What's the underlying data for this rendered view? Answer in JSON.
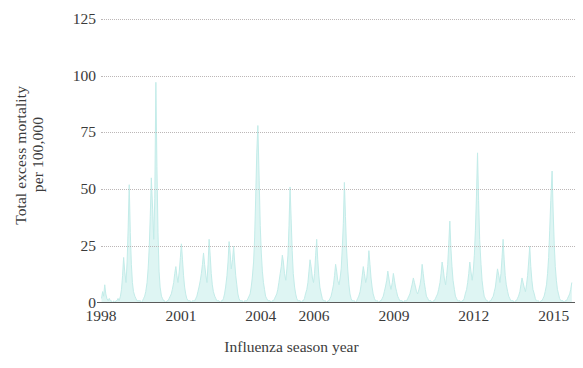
{
  "chart_data": {
    "type": "line",
    "title": "",
    "subtitle": "",
    "xlabel": "Influenza season year",
    "ylabel": "Total excess mortality per 100,000",
    "ylabel_line1": "Total excess mortality",
    "ylabel_line2": "per 100,000",
    "grid": true,
    "grid_style": "dotted",
    "legend": "none",
    "series_color": "#c3ece9",
    "axis_color": "#5a5a5a",
    "grid_color": "#b9b4b4",
    "xlim": [
      1998.0,
      2015.8
    ],
    "ylim": [
      0,
      131
    ],
    "yticks": [
      0,
      25,
      50,
      75,
      100,
      125
    ],
    "ytick_labels": [
      "0",
      "25",
      "50",
      "75",
      "100",
      "125"
    ],
    "xticks": [
      1998,
      2001,
      2004,
      2006,
      2009,
      2012,
      2015
    ],
    "xtick_labels": [
      "1998",
      "2001",
      "2004",
      "2006",
      "2009",
      "2012",
      "2015"
    ],
    "series": [
      {
        "name": "Total excess mortality per 100,000",
        "x": [
          1998.02,
          1998.06,
          1998.1,
          1998.14,
          1998.18,
          1998.22,
          1998.27,
          1998.31,
          1998.35,
          1998.39,
          1998.43,
          1998.48,
          1998.52,
          1998.56,
          1998.6,
          1998.64,
          1998.68,
          1998.73,
          1998.77,
          1998.81,
          1998.85,
          1998.89,
          1998.94,
          1998.98,
          1999.02,
          1999.06,
          1999.1,
          1999.14,
          1999.18,
          1999.22,
          1999.27,
          1999.31,
          1999.35,
          1999.39,
          1999.43,
          1999.48,
          1999.52,
          1999.56,
          1999.6,
          1999.64,
          1999.68,
          1999.73,
          1999.77,
          1999.81,
          1999.85,
          1999.89,
          1999.94,
          1999.98,
          2000.02,
          2000.06,
          2000.1,
          2000.14,
          2000.18,
          2000.22,
          2000.27,
          2000.31,
          2000.35,
          2000.39,
          2000.43,
          2000.48,
          2000.52,
          2000.56,
          2000.6,
          2000.64,
          2000.68,
          2000.73,
          2000.77,
          2000.81,
          2000.85,
          2000.89,
          2000.94,
          2000.98,
          2001.02,
          2001.06,
          2001.1,
          2001.14,
          2001.18,
          2001.22,
          2001.27,
          2001.31,
          2001.35,
          2001.39,
          2001.43,
          2001.48,
          2001.52,
          2001.56,
          2001.6,
          2001.64,
          2001.68,
          2001.73,
          2001.77,
          2001.81,
          2001.85,
          2001.89,
          2001.94,
          2001.98,
          2002.02,
          2002.06,
          2002.1,
          2002.14,
          2002.18,
          2002.22,
          2002.27,
          2002.31,
          2002.35,
          2002.39,
          2002.43,
          2002.48,
          2002.52,
          2002.56,
          2002.6,
          2002.64,
          2002.68,
          2002.73,
          2002.77,
          2002.81,
          2002.85,
          2002.89,
          2002.94,
          2002.98,
          2003.02,
          2003.06,
          2003.1,
          2003.14,
          2003.18,
          2003.22,
          2003.27,
          2003.31,
          2003.35,
          2003.39,
          2003.43,
          2003.48,
          2003.52,
          2003.56,
          2003.6,
          2003.64,
          2003.68,
          2003.73,
          2003.77,
          2003.81,
          2003.85,
          2003.89,
          2003.94,
          2003.98,
          2004.02,
          2004.06,
          2004.1,
          2004.14,
          2004.18,
          2004.22,
          2004.27,
          2004.31,
          2004.35,
          2004.39,
          2004.43,
          2004.48,
          2004.52,
          2004.56,
          2004.6,
          2004.64,
          2004.68,
          2004.73,
          2004.77,
          2004.81,
          2004.85,
          2004.89,
          2004.94,
          2004.98,
          2005.02,
          2005.06,
          2005.1,
          2005.14,
          2005.18,
          2005.22,
          2005.27,
          2005.31,
          2005.35,
          2005.39,
          2005.43,
          2005.48,
          2005.52,
          2005.56,
          2005.6,
          2005.64,
          2005.68,
          2005.73,
          2005.77,
          2005.81,
          2005.85,
          2005.89,
          2005.94,
          2005.98,
          2006.02,
          2006.06,
          2006.1,
          2006.14,
          2006.18,
          2006.22,
          2006.27,
          2006.31,
          2006.35,
          2006.39,
          2006.43,
          2006.48,
          2006.52,
          2006.56,
          2006.6,
          2006.64,
          2006.68,
          2006.73,
          2006.77,
          2006.81,
          2006.85,
          2006.89,
          2006.94,
          2006.98,
          2007.02,
          2007.06,
          2007.1,
          2007.14,
          2007.18,
          2007.22,
          2007.27,
          2007.31,
          2007.35,
          2007.39,
          2007.43,
          2007.48,
          2007.52,
          2007.56,
          2007.6,
          2007.64,
          2007.68,
          2007.73,
          2007.77,
          2007.81,
          2007.85,
          2007.89,
          2007.94,
          2007.98,
          2008.02,
          2008.06,
          2008.1,
          2008.14,
          2008.18,
          2008.22,
          2008.27,
          2008.31,
          2008.35,
          2008.39,
          2008.43,
          2008.48,
          2008.52,
          2008.56,
          2008.6,
          2008.64,
          2008.68,
          2008.73,
          2008.77,
          2008.81,
          2008.85,
          2008.89,
          2008.94,
          2008.98,
          2009.02,
          2009.06,
          2009.1,
          2009.14,
          2009.18,
          2009.22,
          2009.27,
          2009.31,
          2009.35,
          2009.39,
          2009.43,
          2009.48,
          2009.52,
          2009.56,
          2009.6,
          2009.64,
          2009.68,
          2009.73,
          2009.77,
          2009.81,
          2009.85,
          2009.89,
          2009.94,
          2009.98,
          2010.02,
          2010.06,
          2010.1,
          2010.14,
          2010.18,
          2010.22,
          2010.27,
          2010.31,
          2010.35,
          2010.39,
          2010.43,
          2010.48,
          2010.52,
          2010.56,
          2010.6,
          2010.64,
          2010.68,
          2010.73,
          2010.77,
          2010.81,
          2010.85,
          2010.89,
          2010.94,
          2010.98,
          2011.02,
          2011.06,
          2011.1,
          2011.14,
          2011.18,
          2011.22,
          2011.27,
          2011.31,
          2011.35,
          2011.39,
          2011.43,
          2011.48,
          2011.52,
          2011.56,
          2011.6,
          2011.64,
          2011.68,
          2011.73,
          2011.77,
          2011.81,
          2011.85,
          2011.89,
          2011.94,
          2011.98,
          2012.02,
          2012.06,
          2012.1,
          2012.14,
          2012.18,
          2012.22,
          2012.27,
          2012.31,
          2012.35,
          2012.39,
          2012.43,
          2012.48,
          2012.52,
          2012.56,
          2012.6,
          2012.64,
          2012.68,
          2012.73,
          2012.77,
          2012.81,
          2012.85,
          2012.89,
          2012.94,
          2012.98,
          2013.02,
          2013.06,
          2013.1,
          2013.14,
          2013.18,
          2013.22,
          2013.27,
          2013.31,
          2013.35,
          2013.39,
          2013.43,
          2013.48,
          2013.52,
          2013.56,
          2013.6,
          2013.64,
          2013.68,
          2013.73,
          2013.77,
          2013.81,
          2013.85,
          2013.89,
          2013.94,
          2013.98,
          2014.02,
          2014.06,
          2014.1,
          2014.14,
          2014.18,
          2014.22,
          2014.27,
          2014.31,
          2014.35,
          2014.39,
          2014.43,
          2014.48,
          2014.52,
          2014.56,
          2014.6,
          2014.64,
          2014.68,
          2014.73,
          2014.77,
          2014.81,
          2014.85,
          2014.89,
          2014.94,
          2014.98,
          2015.02,
          2015.06,
          2015.1,
          2015.14,
          2015.18,
          2015.22,
          2015.27,
          2015.31,
          2015.35,
          2015.39,
          2015.43,
          2015.48,
          2015.52,
          2015.56,
          2015.6,
          2015.64,
          2015.68
        ],
        "values": [
          2,
          5,
          3,
          8,
          4,
          2,
          1,
          2,
          1,
          1,
          0,
          1,
          0,
          1,
          1,
          2,
          1,
          3,
          6,
          12,
          20,
          14,
          9,
          18,
          33,
          52,
          31,
          17,
          9,
          5,
          3,
          2,
          1,
          1,
          1,
          1,
          0,
          1,
          2,
          3,
          5,
          9,
          15,
          24,
          38,
          55,
          41,
          28,
          46,
          97,
          60,
          31,
          14,
          7,
          3,
          2,
          1,
          1,
          0,
          1,
          1,
          2,
          3,
          4,
          6,
          9,
          13,
          16,
          12,
          9,
          14,
          20,
          26,
          19,
          12,
          7,
          4,
          2,
          1,
          1,
          1,
          0,
          1,
          1,
          1,
          2,
          3,
          5,
          7,
          10,
          13,
          17,
          22,
          17,
          12,
          9,
          17,
          28,
          21,
          13,
          8,
          5,
          3,
          2,
          1,
          1,
          1,
          0,
          1,
          1,
          2,
          4,
          7,
          12,
          18,
          27,
          22,
          15,
          19,
          25,
          18,
          12,
          8,
          4,
          2,
          1,
          1,
          1,
          0,
          1,
          1,
          1,
          2,
          3,
          4,
          7,
          11,
          18,
          29,
          47,
          66,
          78,
          54,
          34,
          22,
          14,
          9,
          6,
          3,
          2,
          1,
          1,
          1,
          0,
          1,
          1,
          2,
          3,
          4,
          6,
          9,
          13,
          16,
          21,
          18,
          13,
          10,
          15,
          21,
          34,
          51,
          37,
          23,
          13,
          7,
          4,
          2,
          1,
          1,
          1,
          0,
          1,
          1,
          2,
          4,
          6,
          9,
          14,
          19,
          16,
          11,
          9,
          13,
          21,
          28,
          19,
          12,
          7,
          4,
          2,
          1,
          1,
          1,
          0,
          1,
          1,
          2,
          3,
          5,
          8,
          12,
          17,
          14,
          10,
          8,
          11,
          15,
          24,
          35,
          53,
          38,
          24,
          14,
          8,
          4,
          2,
          1,
          1,
          1,
          0,
          1,
          2,
          3,
          5,
          8,
          12,
          16,
          13,
          9,
          11,
          16,
          23,
          17,
          11,
          7,
          4,
          2,
          1,
          1,
          1,
          0,
          1,
          1,
          2,
          3,
          5,
          7,
          10,
          14,
          11,
          8,
          6,
          9,
          13,
          10,
          7,
          5,
          3,
          2,
          1,
          1,
          1,
          0,
          1,
          1,
          1,
          2,
          3,
          4,
          6,
          8,
          11,
          9,
          7,
          5,
          4,
          6,
          8,
          11,
          17,
          13,
          9,
          6,
          3,
          2,
          1,
          1,
          1,
          0,
          1,
          1,
          2,
          3,
          4,
          6,
          9,
          13,
          18,
          15,
          11,
          8,
          12,
          17,
          26,
          36,
          24,
          16,
          10,
          6,
          3,
          2,
          1,
          1,
          1,
          0,
          1,
          1,
          2,
          4,
          6,
          9,
          13,
          18,
          14,
          10,
          14,
          21,
          32,
          47,
          66,
          45,
          28,
          17,
          10,
          6,
          3,
          2,
          1,
          1,
          0,
          1,
          1,
          2,
          3,
          5,
          7,
          11,
          15,
          12,
          9,
          13,
          20,
          28,
          19,
          12,
          8,
          5,
          3,
          2,
          1,
          1,
          1,
          0,
          1,
          1,
          2,
          3,
          5,
          8,
          11,
          9,
          7,
          5,
          8,
          12,
          18,
          25,
          16,
          10,
          6,
          4,
          2,
          1,
          1,
          1,
          0,
          1,
          1,
          2,
          3,
          5,
          8,
          13,
          20,
          32,
          45,
          58,
          40,
          26,
          16,
          10,
          6,
          4,
          2,
          1,
          1,
          1,
          0,
          1,
          1,
          2,
          3,
          4,
          6,
          9
        ]
      }
    ]
  }
}
